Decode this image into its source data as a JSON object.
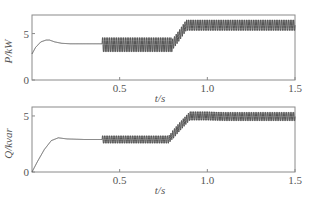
{
  "chart_data": [
    {
      "type": "line",
      "title": "",
      "xlabel": "t/s",
      "ylabel": "P/kW",
      "xlim": [
        0,
        1.5
      ],
      "ylim": [
        0,
        7
      ],
      "xticks": [
        0.5,
        1.0,
        1.5
      ],
      "xtick_labels": [
        "0.5",
        "1.0",
        "1.5"
      ],
      "yticks": [
        0,
        5
      ],
      "ytick_labels": [
        "0",
        "5"
      ],
      "grid": false,
      "series": [
        {
          "name": "P",
          "x": [
            0.0,
            0.02,
            0.05,
            0.08,
            0.1,
            0.13,
            0.17,
            0.22,
            0.3,
            0.4,
            0.4,
            0.5,
            0.6,
            0.7,
            0.8,
            0.84,
            0.88,
            0.9,
            1.0,
            1.1,
            1.2,
            1.3,
            1.4,
            1.5
          ],
          "y": [
            2.8,
            3.5,
            4.1,
            4.3,
            4.3,
            4.1,
            3.95,
            3.9,
            3.9,
            3.9,
            3.8,
            3.8,
            3.8,
            3.8,
            3.8,
            4.8,
            5.9,
            5.9,
            5.9,
            5.9,
            5.9,
            5.9,
            5.9,
            5.9
          ],
          "oscillation": [
            {
              "t_start": 0.4,
              "t_end": 0.8,
              "min": 3.0,
              "max": 4.6
            },
            {
              "t_start": 0.8,
              "t_end": 1.5,
              "min": 5.3,
              "max": 6.5
            }
          ]
        }
      ]
    },
    {
      "type": "line",
      "title": "",
      "xlabel": "t/s",
      "ylabel": "Q/kvar",
      "xlim": [
        0,
        1.5
      ],
      "ylim": [
        0,
        5.8
      ],
      "xticks": [
        0.5,
        1.0,
        1.5
      ],
      "xtick_labels": [
        "0.5",
        "1.0",
        "1.5"
      ],
      "yticks": [
        0,
        5
      ],
      "ytick_labels": [
        "0",
        "5"
      ],
      "grid": false,
      "series": [
        {
          "name": "Q",
          "x": [
            0.0,
            0.03,
            0.07,
            0.11,
            0.15,
            0.2,
            0.3,
            0.4,
            0.4,
            0.5,
            0.6,
            0.7,
            0.78,
            0.84,
            0.9,
            1.0,
            1.1,
            1.2,
            1.3,
            1.4,
            1.5
          ],
          "y": [
            0.0,
            0.9,
            2.0,
            2.8,
            3.05,
            2.95,
            2.9,
            2.9,
            2.9,
            2.9,
            2.9,
            2.9,
            2.9,
            4.0,
            5.0,
            5.0,
            4.95,
            4.95,
            4.95,
            4.95,
            4.95
          ],
          "oscillation": [
            {
              "t_start": 0.4,
              "t_end": 0.8,
              "min": 2.6,
              "max": 3.3
            },
            {
              "t_start": 0.8,
              "t_end": 1.5,
              "min": 4.6,
              "max": 5.4
            }
          ]
        }
      ]
    }
  ],
  "layout": {
    "panels": [
      {
        "left": 32,
        "right": 295,
        "top": 15,
        "bottom": 80
      },
      {
        "left": 32,
        "right": 295,
        "top": 107,
        "bottom": 172
      }
    ]
  }
}
